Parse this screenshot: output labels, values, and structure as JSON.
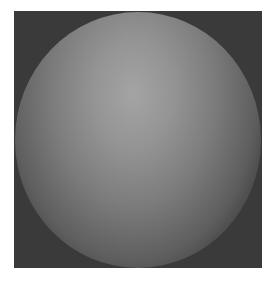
{
  "image": {
    "subject": "shaded gray sphere on dark square background",
    "background_color": "#3a3a3a",
    "highlight_color": "#a4a4a4",
    "shadow_color": "#161616",
    "page_color": "#ffffff"
  },
  "caption": ""
}
